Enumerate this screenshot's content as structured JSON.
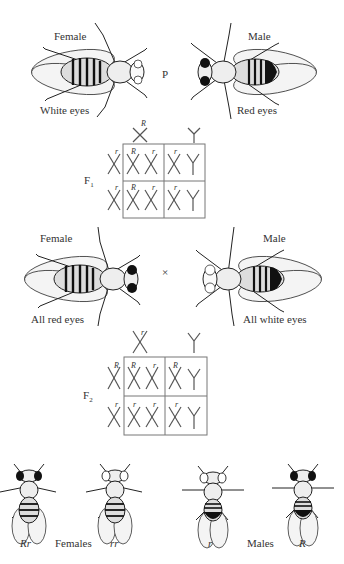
{
  "parental": {
    "generation_label": "P",
    "female": {
      "sex_label": "Female",
      "phenotype": "White eyes",
      "eye_color": "#ffffff"
    },
    "male": {
      "sex_label": "Male",
      "phenotype": "Red eyes",
      "eye_color": "#1a1a1a"
    }
  },
  "f1": {
    "generation_label": "F",
    "generation_sub": "1",
    "gametes_top": [
      {
        "chrom": "X",
        "allele": "R"
      },
      {
        "chrom": "Y",
        "allele": ""
      }
    ],
    "gametes_side": [
      {
        "chrom": "X",
        "allele": "r"
      },
      {
        "chrom": "X",
        "allele": "r"
      }
    ],
    "cells": [
      [
        {
          "c1": "X",
          "a1": "R",
          "c2": "X",
          "a2": "r"
        },
        {
          "c1": "X",
          "a1": "r",
          "c2": "Y",
          "a2": ""
        }
      ],
      [
        {
          "c1": "X",
          "a1": "R",
          "c2": "X",
          "a2": "r"
        },
        {
          "c1": "X",
          "a1": "r",
          "c2": "Y",
          "a2": ""
        }
      ]
    ]
  },
  "f1_cross": {
    "cross_symbol": "×",
    "female": {
      "sex_label": "Female",
      "phenotype": "All red eyes"
    },
    "male": {
      "sex_label": "Male",
      "phenotype": "All white eyes"
    }
  },
  "f2": {
    "generation_label": "F",
    "generation_sub": "2",
    "gametes_top": [
      {
        "chrom": "X",
        "allele": "r"
      },
      {
        "chrom": "Y",
        "allele": ""
      }
    ],
    "gametes_side": [
      {
        "chrom": "X",
        "allele": "R"
      },
      {
        "chrom": "X",
        "allele": "r"
      }
    ],
    "cells": [
      [
        {
          "c1": "X",
          "a1": "R",
          "c2": "X",
          "a2": "r"
        },
        {
          "c1": "X",
          "a1": "R",
          "c2": "Y",
          "a2": ""
        }
      ],
      [
        {
          "c1": "X",
          "a1": "r",
          "c2": "X",
          "a2": "r"
        },
        {
          "c1": "X",
          "a1": "r",
          "c2": "Y",
          "a2": ""
        }
      ]
    ]
  },
  "offspring": {
    "females_label": "Females",
    "males_label": "Males",
    "genotypes": [
      "Rr",
      "rr",
      "r",
      "R"
    ]
  }
}
